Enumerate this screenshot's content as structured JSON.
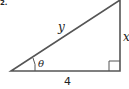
{
  "problem_number_fragment": "2.",
  "diagram": {
    "type": "right-triangle",
    "labels": {
      "hypotenuse": "y",
      "opposite": "x",
      "adjacent": "4",
      "angle": "θ"
    },
    "right_angle_marker": true,
    "stroke_color": "#555555"
  }
}
